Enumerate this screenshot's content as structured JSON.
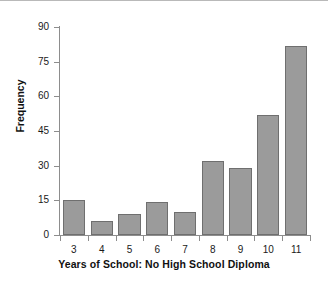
{
  "chart_data": {
    "type": "bar",
    "title": "",
    "xlabel": "Years of School: No High School Diploma",
    "ylabel": "Frequency",
    "categories": [
      "3",
      "4",
      "5",
      "6",
      "7",
      "8",
      "9",
      "10",
      "11"
    ],
    "values": [
      15,
      6,
      9,
      14.5,
      10,
      32,
      29,
      52,
      82
    ],
    "ylim": [
      0,
      90
    ],
    "yticks": [
      0,
      15,
      30,
      45,
      60,
      75,
      90
    ],
    "ytick_labels": [
      "0",
      "15",
      "30",
      "45",
      "60",
      "75",
      "90"
    ],
    "grid": false,
    "legend": null,
    "bar_color": "#9b9b9b",
    "bar_edge_color": "#6f6f6f",
    "background_color": "#ffffff",
    "axis_color": "#8d8d8d",
    "text_color": "#111111"
  }
}
